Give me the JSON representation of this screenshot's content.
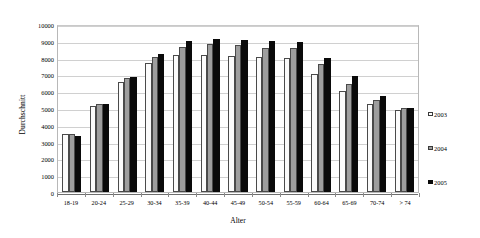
{
  "chart_data": {
    "type": "bar",
    "title": "",
    "xlabel": "Alter",
    "ylabel": "Durchschnitt",
    "ylim": [
      0,
      10000
    ],
    "ytick_step": 1000,
    "yticks": [
      "10000",
      "9000",
      "8000",
      "7000",
      "6000",
      "5000",
      "4000",
      "3000",
      "2000",
      "1000",
      "0"
    ],
    "grid": true,
    "legend_position": "right",
    "categories": [
      "18-19",
      "20-24",
      "25-29",
      "30-34",
      "35-39",
      "40-44",
      "45-49",
      "50-54",
      "55-59",
      "60-64",
      "65-69",
      "70-74",
      "> 74"
    ],
    "series": [
      {
        "name": "2003",
        "color": "#fbfbfb",
        "values": [
          3450,
          5100,
          6550,
          7700,
          8150,
          8150,
          8100,
          8050,
          8000,
          7000,
          6000,
          5250,
          4900
        ]
      },
      {
        "name": "2004",
        "color": "#9e9e9e",
        "values": [
          3450,
          5250,
          6800,
          8050,
          8650,
          8800,
          8750,
          8600,
          8550,
          7600,
          6450,
          5500,
          5000
        ]
      },
      {
        "name": "2005",
        "color": "#0a0a0a",
        "values": [
          3350,
          5250,
          6850,
          8200,
          9000,
          9100,
          9050,
          9000,
          8950,
          7950,
          6900,
          5700,
          5000
        ]
      }
    ]
  },
  "legend": {
    "items": [
      {
        "label": "2003",
        "swatch": "swatch-white"
      },
      {
        "label": "2004",
        "swatch": "swatch-gray"
      },
      {
        "label": "2005",
        "swatch": "swatch-black"
      }
    ]
  },
  "colors": {
    "series_2003": "#fbfbfb",
    "series_2004": "#9e9e9e",
    "series_2005": "#0a0a0a",
    "gridline": "#d0d0d0",
    "axis": "#6e6e6e",
    "plot_border": "#b8b8b8"
  }
}
